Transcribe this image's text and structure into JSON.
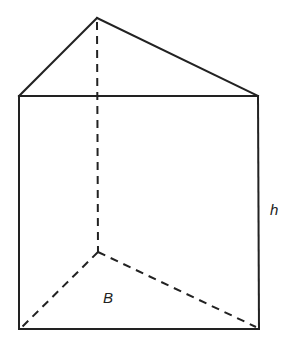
{
  "diagram": {
    "type": "triangular prism",
    "labels": {
      "height": "h",
      "base": "B"
    },
    "vertices": {
      "top_apex": [
        97,
        18
      ],
      "top_left": [
        19,
        96
      ],
      "top_right": [
        258,
        96
      ],
      "bottom_back": [
        98,
        252
      ],
      "bottom_left": [
        19,
        329
      ],
      "bottom_right": [
        259,
        329
      ]
    },
    "colors": {
      "stroke": "#222222",
      "background": "#ffffff"
    }
  }
}
